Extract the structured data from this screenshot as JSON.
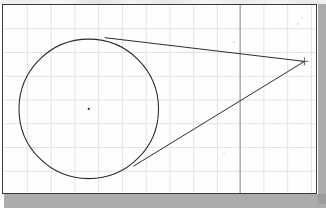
{
  "canvas": {
    "width": 326,
    "height": 208,
    "sheet": {
      "x": 2,
      "y": 4,
      "width": 315,
      "height": 190
    },
    "paper_color": "#fefefe",
    "border_color": "#3a3a3a",
    "shadow_color": "#9a9a9a",
    "ink_color": "#2b2b2b",
    "grid_color": "#e3e3e3",
    "grid_major_color": "#8d8d8d"
  },
  "grid": {
    "label": "graph-paper-grid",
    "cell_size": 24,
    "origin_x": 2,
    "origin_y": 4,
    "vertical_lines": [
      26,
      50,
      74,
      98,
      122,
      146,
      170,
      194,
      218,
      241,
      265,
      289,
      313
    ],
    "horizontal_lines": [
      28,
      52,
      76,
      100,
      124,
      148,
      172
    ],
    "major_vertical_lines": [
      241
    ],
    "show_grid": true
  },
  "figure": {
    "circle": {
      "name": "circle",
      "center_x": 88,
      "center_y": 109,
      "radius": 70.5,
      "stroke": "#2b2b2b",
      "stroke_width": 1.1
    },
    "center_point": {
      "name": "circle-center-point",
      "x": 88,
      "y": 109,
      "marker": "dot",
      "size": 2.2
    },
    "external_point": {
      "name": "external-point",
      "x": 306,
      "y": 61,
      "marker": "cross",
      "size": 4
    },
    "tangent_lines": [
      {
        "name": "upper-tangent-line",
        "from_x": 104,
        "from_y": 37,
        "to_x": 306,
        "to_y": 61,
        "tangent_point_x": 104,
        "tangent_point_y": 37
      },
      {
        "name": "lower-tangent-line",
        "from_x": 133,
        "from_y": 167,
        "to_x": 306,
        "to_y": 61,
        "tangent_point_x": 133,
        "tangent_point_y": 167
      }
    ]
  },
  "specks": [
    {
      "x": 232,
      "y": 40,
      "size": 2
    },
    {
      "x": 222,
      "y": 152,
      "size": 2
    },
    {
      "x": 300,
      "y": 16,
      "size": 2
    },
    {
      "x": 296,
      "y": 22,
      "size": 1.5
    },
    {
      "x": 156,
      "y": 118,
      "size": 1.4
    },
    {
      "x": 60,
      "y": 186,
      "size": 1.4
    },
    {
      "x": 186,
      "y": 62,
      "size": 1.3
    }
  ]
}
